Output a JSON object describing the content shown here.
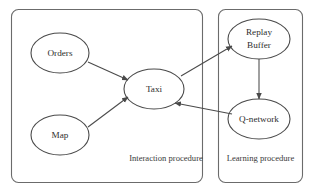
{
  "diagram": {
    "type": "flow-diagram",
    "background_color": "#ffffff",
    "stroke_color": "#4a4a4a",
    "panel_stroke_color": "#6b6b6b",
    "text_color": "#2e2e2e",
    "panels": [
      {
        "id": "interaction",
        "label": "Interaction procedure"
      },
      {
        "id": "learning",
        "label": "Learning procedure"
      }
    ],
    "nodes": [
      {
        "id": "orders",
        "label": "Orders",
        "panel": "interaction"
      },
      {
        "id": "map",
        "label": "Map",
        "panel": "interaction"
      },
      {
        "id": "taxi",
        "label": "Taxi",
        "panel": "interaction"
      },
      {
        "id": "replay_buffer",
        "label_line1": "Replay",
        "label_line2": "Buffer",
        "label": "Replay Buffer",
        "panel": "learning"
      },
      {
        "id": "q_network",
        "label": "Q-network",
        "panel": "learning"
      }
    ],
    "edges": [
      {
        "from": "orders",
        "to": "taxi"
      },
      {
        "from": "map",
        "to": "taxi"
      },
      {
        "from": "taxi",
        "to": "replay_buffer"
      },
      {
        "from": "replay_buffer",
        "to": "q_network"
      },
      {
        "from": "q_network",
        "to": "taxi"
      }
    ]
  }
}
